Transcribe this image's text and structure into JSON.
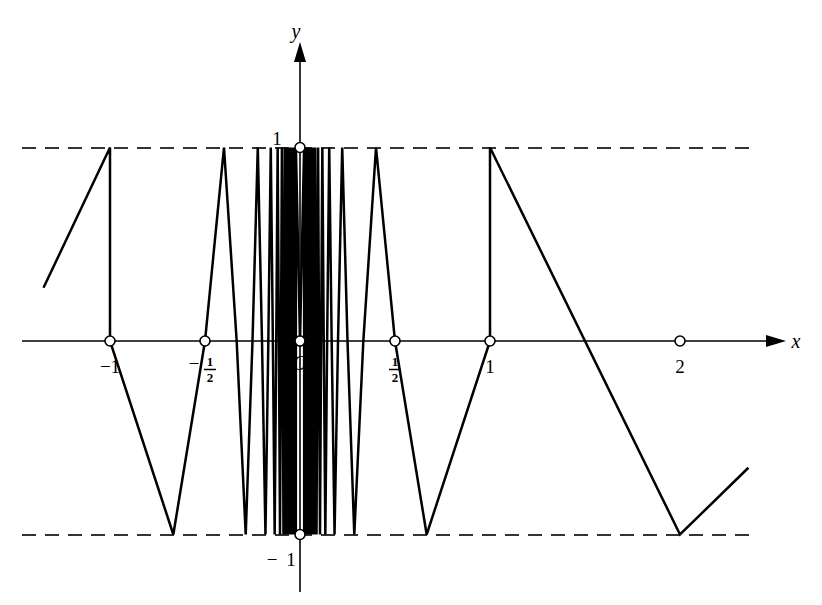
{
  "figure": {
    "kind": "math-plot",
    "background": "#ffffff",
    "ink_color": "#000000"
  },
  "axes": {
    "x_axis_label": "x",
    "y_axis_label": "y",
    "origin_label": "O",
    "x_ticks": [
      {
        "value": -1,
        "label": "-1",
        "label_kind": "plain"
      },
      {
        "value": -0.5,
        "label": "-1/2",
        "label_kind": "fraction",
        "numerator": "1",
        "denominator": "2",
        "sign": "−"
      },
      {
        "value": 0,
        "label": "",
        "label_kind": "origin"
      },
      {
        "value": 0.5,
        "label": "1/2",
        "label_kind": "fraction",
        "numerator": "1",
        "denominator": "2",
        "sign": ""
      },
      {
        "value": 1,
        "label": "1",
        "label_kind": "plain"
      },
      {
        "value": 2,
        "label": "2",
        "label_kind": "plain"
      }
    ],
    "y_ticks": [
      {
        "value": 1,
        "label": "1"
      },
      {
        "value": -1,
        "label": "-1"
      }
    ],
    "xlim": [
      -1.35,
      2.45
    ],
    "ylim": [
      -1.38,
      1.42
    ],
    "x_arrow": true,
    "y_arrow": true,
    "grid": false
  },
  "asymptotes": {
    "upper": 1,
    "lower": -1,
    "style": "dashed",
    "color": "#333333"
  },
  "chart_data": {
    "type": "line",
    "title": "",
    "xlabel": "x",
    "ylabel": "y",
    "xlim": [
      -1.35,
      2.45
    ],
    "ylim": [
      -1.38,
      1.42
    ],
    "grid": false,
    "legend": null,
    "series": [
      {
        "name": "triangle-wave oscillation",
        "description": "Triangular analogue of sin(1/x): zeros at x = 1/n, peaks of amplitude +/-1 midway between consecutive zeros, oscillating infinitely fast as x approaches 0.",
        "zeros_at": "x = 1/n for integer n",
        "amplitude": 1,
        "accumulation_point": 0,
        "left_endpoint": {
          "x": -1.35,
          "y": 0.275
        },
        "right_endpoint": {
          "x": 2.36,
          "y": -0.655
        },
        "key_vertices": [
          {
            "x": -1.35,
            "y": 0.275
          },
          {
            "x": -1.0,
            "y": 1.0
          },
          {
            "x": -0.667,
            "y": -1.0
          },
          {
            "x": -0.5,
            "y": 0.0
          },
          {
            "x": -0.4,
            "y": 1.0
          },
          {
            "x": -0.333,
            "y": 0.0
          },
          {
            "x": -0.2857,
            "y": -1.0
          },
          {
            "x": -0.25,
            "y": 0.0
          },
          {
            "x": -0.2222,
            "y": 1.0
          },
          {
            "x": -0.2,
            "y": 0.0
          },
          {
            "x": 0.0,
            "y": 0.0
          },
          {
            "x": 0.2,
            "y": 0.0
          },
          {
            "x": 0.2222,
            "y": 1.0
          },
          {
            "x": 0.25,
            "y": 0.0
          },
          {
            "x": 0.2857,
            "y": -1.0
          },
          {
            "x": 0.3333,
            "y": 0.0
          },
          {
            "x": 0.4,
            "y": 1.0
          },
          {
            "x": 0.5,
            "y": 0.0
          },
          {
            "x": 0.667,
            "y": -1.0
          },
          {
            "x": 1.0,
            "y": 1.0
          },
          {
            "x": 2.0,
            "y": -1.0
          },
          {
            "x": 2.36,
            "y": -0.655
          }
        ],
        "marked_points": [
          {
            "x": 0,
            "y": 1,
            "marker": "open-circle"
          },
          {
            "x": 0,
            "y": -1,
            "marker": "open-circle"
          },
          {
            "x": 0,
            "y": 0,
            "marker": "open-circle"
          }
        ]
      }
    ]
  },
  "markers": {
    "style": "open-circle",
    "fill": "#ffffff",
    "stroke": "#000000",
    "radius": 5
  }
}
